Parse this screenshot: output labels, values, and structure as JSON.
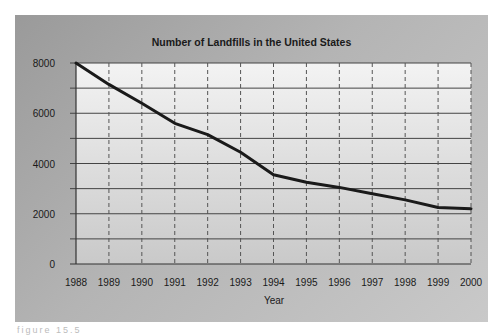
{
  "chart_data": {
    "type": "line",
    "title": "Number of Landfills in the United States",
    "xlabel": "Year",
    "ylabel": "",
    "x": [
      "1988",
      "1989",
      "1990",
      "1991",
      "1992",
      "1993",
      "1994",
      "1995",
      "1996",
      "1997",
      "1998",
      "1999",
      "2000"
    ],
    "series": [
      {
        "name": "Landfills",
        "values": [
          8000,
          7150,
          6400,
          5600,
          5150,
          4450,
          3550,
          3250,
          3050,
          2800,
          2550,
          2250,
          2200
        ]
      }
    ],
    "ylim": [
      0,
      8000
    ],
    "yticks": [
      0,
      2000,
      4000,
      6000,
      8000
    ],
    "ygrid_step": 1000,
    "grid": {
      "horizontal": "solid",
      "vertical": "dashed"
    },
    "legend": "none",
    "colors": {
      "line": "#1a1a1a",
      "panel": "#b0b0b0",
      "plot_bg_top": "#f2f2f2",
      "plot_bg_bottom": "#c8c8c8"
    }
  },
  "caption": "figure 15.5"
}
